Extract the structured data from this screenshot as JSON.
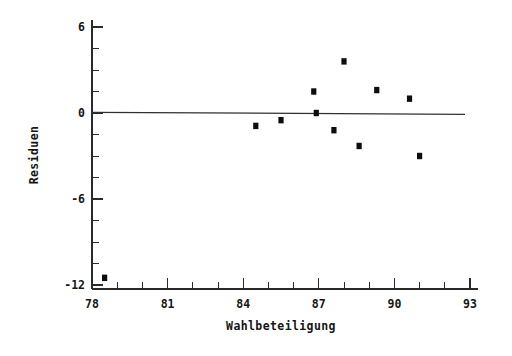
{
  "chart_data": {
    "type": "scatter",
    "title": "",
    "xlabel": "Wahlbeteiligung",
    "ylabel": "Residuen",
    "xlim": [
      78,
      93
    ],
    "ylim": [
      -12,
      6
    ],
    "grid": false,
    "legend": "none",
    "xticks": [
      78,
      81,
      84,
      87,
      90,
      93
    ],
    "xtick_labels": [
      "78",
      "81",
      "84",
      "87",
      "90",
      "93"
    ],
    "yticks": [
      6,
      0,
      -6,
      -12
    ],
    "ytick_labels": [
      "6",
      "0",
      "-6",
      "-12"
    ],
    "x_minor_interval": 1,
    "y_minor_interval": 1.5,
    "marker": "square",
    "marker_color": "#0d0d0d",
    "points": [
      {
        "x": 78.5,
        "y": -11.5
      },
      {
        "x": 84.5,
        "y": -0.9
      },
      {
        "x": 85.5,
        "y": -0.5
      },
      {
        "x": 86.8,
        "y": 1.5
      },
      {
        "x": 86.9,
        "y": 0.0
      },
      {
        "x": 88.0,
        "y": 3.6
      },
      {
        "x": 87.6,
        "y": -1.2
      },
      {
        "x": 88.6,
        "y": -2.3
      },
      {
        "x": 89.3,
        "y": 1.6
      },
      {
        "x": 90.6,
        "y": 1.0
      },
      {
        "x": 91.0,
        "y": -3.0
      }
    ],
    "reference_line": {
      "label": "zero-residual-line",
      "x_start": 78.0,
      "x_end": 92.8,
      "y_start": 0.05,
      "y_end": -0.1,
      "color": "#303030"
    }
  },
  "axes": {
    "x_axis_name": "Wahlbeteiligung",
    "y_axis_name": "Residuen"
  }
}
